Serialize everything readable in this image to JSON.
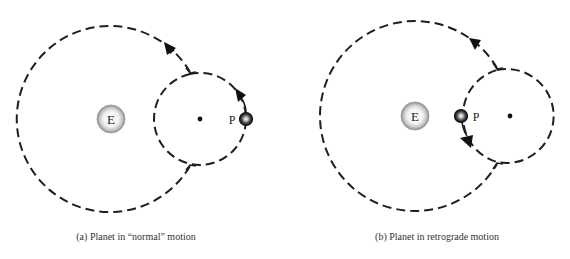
{
  "panels": [
    {
      "id": "a",
      "caption": "(a) Planet in “normal” motion",
      "earth_label": "E",
      "planet_label": "P",
      "motion": "normal"
    },
    {
      "id": "b",
      "caption": "(b) Planet in retrograde motion",
      "earth_label": "E",
      "planet_label": "P",
      "motion": "retrograde"
    }
  ],
  "colors": {
    "background": "#ffffff",
    "line": "#1f1f1f",
    "caption_text": "#333333"
  }
}
